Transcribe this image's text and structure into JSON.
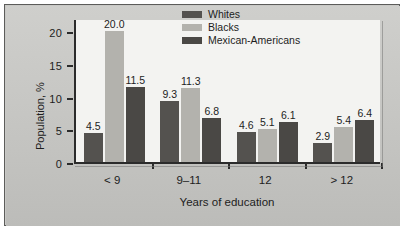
{
  "chart_data": {
    "type": "bar",
    "title": "",
    "xlabel": "Years of education",
    "ylabel": "Population, %",
    "categories": [
      "< 9",
      "9–11",
      "12",
      "> 12"
    ],
    "series": [
      {
        "name": "Whites",
        "color": "#54524f",
        "values": [
          4.5,
          9.3,
          4.6,
          2.9
        ]
      },
      {
        "name": "Blacks",
        "color": "#b3b2ad",
        "values": [
          20.0,
          11.3,
          5.1,
          5.4
        ]
      },
      {
        "name": "Mexican-Americans",
        "color": "#4a4845",
        "values": [
          11.5,
          6.8,
          6.1,
          6.4
        ]
      }
    ],
    "value_labels": [
      [
        "4.5",
        "20.0",
        "11.5"
      ],
      [
        "9.3",
        "11.3",
        "6.8"
      ],
      [
        "4.6",
        "5.1",
        "6.1"
      ],
      [
        "2.9",
        "5.4",
        "6.4"
      ]
    ],
    "ylim": [
      0,
      22
    ],
    "yticks": [
      0,
      5,
      10,
      15,
      20
    ],
    "ytick_labels": [
      "0",
      "5",
      "10",
      "15",
      "20"
    ],
    "grid": false,
    "legend_position": "top-right"
  },
  "legend": {
    "entries": [
      {
        "label": "Whites"
      },
      {
        "label": "Blacks"
      },
      {
        "label": "Mexican-Americans"
      }
    ]
  }
}
